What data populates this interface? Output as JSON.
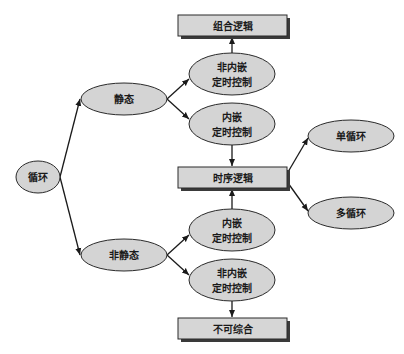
{
  "diagram": {
    "nodes": [
      {
        "id": "loop",
        "shape": "ellipse",
        "lines": [
          "循环"
        ]
      },
      {
        "id": "static",
        "shape": "ellipse",
        "lines": [
          "静态"
        ]
      },
      {
        "id": "nonstatic",
        "shape": "ellipse",
        "lines": [
          "非静态"
        ]
      },
      {
        "id": "comb",
        "shape": "box",
        "lines": [
          "组合逻辑"
        ]
      },
      {
        "id": "s_nonembed",
        "shape": "ellipse",
        "lines": [
          "非内嵌",
          "定时控制"
        ]
      },
      {
        "id": "s_embed",
        "shape": "ellipse",
        "lines": [
          "内嵌",
          "定时控制"
        ]
      },
      {
        "id": "seq",
        "shape": "box",
        "lines": [
          "时序逻辑"
        ]
      },
      {
        "id": "single",
        "shape": "ellipse",
        "lines": [
          "单循环"
        ]
      },
      {
        "id": "multi",
        "shape": "ellipse",
        "lines": [
          "多循环"
        ]
      },
      {
        "id": "n_embed",
        "shape": "ellipse",
        "lines": [
          "内嵌",
          "定时控制"
        ]
      },
      {
        "id": "n_nonembed",
        "shape": "ellipse",
        "lines": [
          "非内嵌",
          "定时控制"
        ]
      },
      {
        "id": "unsynth",
        "shape": "box",
        "lines": [
          "不可综合"
        ]
      }
    ],
    "edges": [
      {
        "from": "loop",
        "to": "static"
      },
      {
        "from": "loop",
        "to": "nonstatic"
      },
      {
        "from": "static",
        "to": "s_nonembed"
      },
      {
        "from": "static",
        "to": "s_embed"
      },
      {
        "from": "s_nonembed",
        "to": "comb"
      },
      {
        "from": "s_embed",
        "to": "seq"
      },
      {
        "from": "seq",
        "to": "single"
      },
      {
        "from": "seq",
        "to": "multi"
      },
      {
        "from": "nonstatic",
        "to": "n_embed"
      },
      {
        "from": "nonstatic",
        "to": "n_nonembed"
      },
      {
        "from": "n_embed",
        "to": "seq"
      },
      {
        "from": "n_nonembed",
        "to": "unsynth"
      }
    ]
  }
}
